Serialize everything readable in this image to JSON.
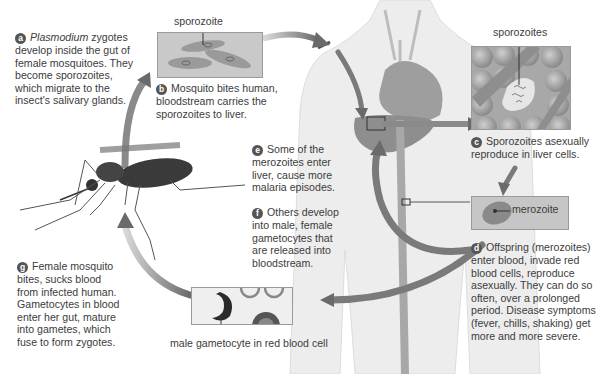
{
  "steps": {
    "a": {
      "badge": "a",
      "italic": "Plasmodium",
      "text_after_italic": " zygotes",
      "lines": [
        "develop inside the gut of",
        "female mosquitoes. They",
        "become sporozoites,",
        "which migrate to the",
        "insect's salivary glands."
      ]
    },
    "b": {
      "badge": "b",
      "first": "Mosquito bites human,",
      "lines": [
        "bloodstream carries the",
        "sporozoites to liver."
      ]
    },
    "c": {
      "badge": "c",
      "first": "Sporozoites asexually",
      "lines": [
        "reproduce in liver cells."
      ]
    },
    "d": {
      "badge": "d",
      "first": "Offspring (merozoites)",
      "lines": [
        "enter blood, invade red",
        "blood cells, reproduce",
        "asexually. They can do so",
        "often, over a prolonged",
        "period. Disease symptoms",
        "(fever, chills, shaking) get",
        "more and more severe."
      ]
    },
    "e": {
      "badge": "e",
      "first": "Some of the",
      "lines": [
        "merozoites enter",
        "liver, cause more",
        "malaria episodes."
      ]
    },
    "f": {
      "badge": "f",
      "first": "Others develop",
      "lines": [
        "into male, female",
        "gametocytes that",
        "are released into",
        "bloodstream."
      ]
    },
    "g": {
      "badge": "g",
      "first": "Female mosquito",
      "lines": [
        "bites, sucks blood",
        "from infected human.",
        "Gametocytes in blood",
        "enter her gut, mature",
        "into gametes, which",
        "fuse to form zygotes."
      ]
    }
  },
  "labels": {
    "sporozoite": "sporozoite",
    "sporozoites": "sporozoites",
    "merozoite": "merozoite",
    "gametocyte": "male gametocyte in red blood cell"
  },
  "colors": {
    "arrow": "#6e6e6e",
    "body": "#ececec",
    "organ": "#9a9a9a",
    "badge": "#555555",
    "panel_bg": "#c8c8c8"
  }
}
